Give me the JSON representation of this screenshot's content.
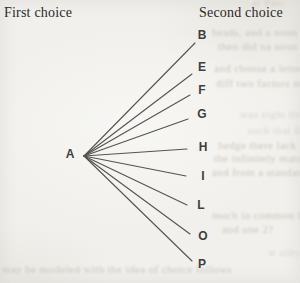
{
  "columns": {
    "first": "First choice",
    "second": "Second choice"
  },
  "tree": {
    "root": "A",
    "choices": [
      "B",
      "E",
      "F",
      "G",
      "H",
      "I",
      "L",
      "O",
      "P"
    ]
  },
  "colors": {
    "paper": "#f1f0ec",
    "ink": "#2b2a28",
    "line": "#55534f",
    "ghost": "#c7c2b6"
  },
  "ghost_fragments": [
    "at Pasc",
    "heads, and a noun ve",
    "then did na noun head",
    "and choose a letter from the alphabet, such as the r",
    "diff two factors my sub choices here from the",
    "was eight ilvey",
    "such that filly",
    "hedge there lack",
    "the infinitely matombi and",
    "and from a standard",
    "much in common between binge",
    "and one 2?",
    "may be modeled with the idea of choice follows",
    "w silty"
  ]
}
